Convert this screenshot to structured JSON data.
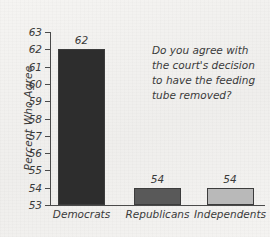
{
  "chart_data": {
    "type": "bar",
    "title": "",
    "subtitle": "",
    "xlabel": "",
    "ylabel": "Percent Who Agree",
    "ylim": [
      53,
      63
    ],
    "ytick_step": 1,
    "yticks": [
      63,
      62,
      61,
      60,
      59,
      58,
      57,
      56,
      55,
      54,
      53
    ],
    "grid": false,
    "legend": "none",
    "categories": [
      "Democrats",
      "Republicans",
      "Independents"
    ],
    "values": [
      62,
      54,
      54
    ],
    "value_labels": [
      "62",
      "54",
      "54"
    ],
    "bar_colors": [
      "#2d2d2d",
      "#595959",
      "#b9b9b9"
    ],
    "annotations": [
      {
        "name": "survey-question",
        "lines": [
          "Do you agree with",
          "the court's decision",
          "to have the feeding",
          "tube removed?"
        ]
      }
    ]
  },
  "style": {
    "background": "#f3f2f0",
    "axis_color": "#4a4a4a",
    "text_color": "#3a3a3a",
    "bar_border": "#3c3c3c"
  }
}
